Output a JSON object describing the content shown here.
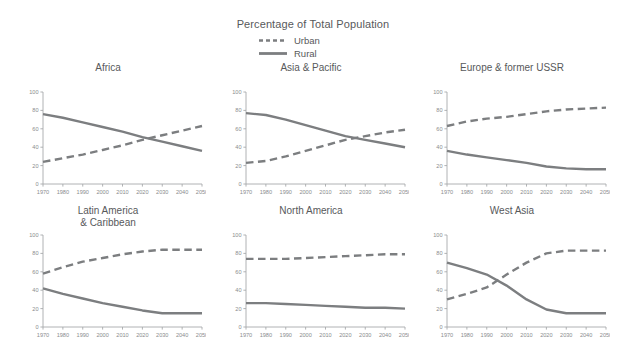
{
  "figure": {
    "title": "Percentage of Total Population",
    "legend": [
      {
        "label": "Urban",
        "style": "dashed",
        "color": "#7c7e80"
      },
      {
        "label": "Rural",
        "style": "solid",
        "color": "#7c7e80"
      }
    ]
  },
  "chart_data": {
    "type": "line",
    "title": "Percentage of Total Population",
    "xlabel": "",
    "ylabel": "",
    "xlim": [
      1970,
      2050
    ],
    "ylim": [
      0,
      100
    ],
    "yticks": [
      0,
      20,
      40,
      60,
      80,
      100
    ],
    "xticks": [
      1970,
      1980,
      1990,
      2000,
      2010,
      2020,
      2030,
      2040,
      2050
    ],
    "grid": false,
    "legend_position": "top-center",
    "legend_entries": [
      "Urban",
      "Rural"
    ],
    "x": [
      1970,
      1980,
      1990,
      2000,
      2010,
      2020,
      2030,
      2040,
      2050
    ],
    "panels": [
      {
        "title": "Africa",
        "title_lines": [
          "Africa"
        ],
        "series": [
          {
            "name": "Urban",
            "style": "dashed",
            "values": [
              24,
              28,
              32,
              37,
              42,
              48,
              53,
              58,
              63
            ]
          },
          {
            "name": "Rural",
            "style": "solid",
            "values": [
              76,
              72,
              67,
              62,
              57,
              51,
              46,
              41,
              36
            ]
          }
        ],
        "crossover_year": 2016,
        "crossover_value": 50
      },
      {
        "title": "Asia & Pacific",
        "title_lines": [
          "Asia & Pacific"
        ],
        "series": [
          {
            "name": "Urban",
            "style": "dashed",
            "values": [
              23,
              25,
              30,
              36,
              42,
              48,
              52,
              56,
              59
            ]
          },
          {
            "name": "Rural",
            "style": "solid",
            "values": [
              77,
              75,
              70,
              64,
              58,
              52,
              48,
              44,
              40
            ]
          }
        ],
        "crossover_year": 2021,
        "crossover_value": 50
      },
      {
        "title": "Europe & former USSR",
        "title_lines": [
          "Europe & former USSR"
        ],
        "series": [
          {
            "name": "Urban",
            "style": "dashed",
            "values": [
              63,
              68,
              71,
              73,
              76,
              79,
              81,
              82,
              83
            ]
          },
          {
            "name": "Rural",
            "style": "solid",
            "values": [
              36,
              32,
              29,
              26,
              23,
              19,
              17,
              16,
              16
            ]
          }
        ],
        "crossover_year": null,
        "crossover_value": null
      },
      {
        "title": "Latin America & Caribbean",
        "title_lines": [
          "Latin America",
          "& Caribbean"
        ],
        "series": [
          {
            "name": "Urban",
            "style": "dashed",
            "values": [
              58,
              65,
              71,
              75,
              79,
              82,
              84,
              84,
              84
            ]
          },
          {
            "name": "Rural",
            "style": "solid",
            "values": [
              42,
              36,
              31,
              26,
              22,
              18,
              15,
              15,
              15
            ]
          }
        ],
        "crossover_year": null,
        "crossover_value": null
      },
      {
        "title": "North America",
        "title_lines": [
          "North America"
        ],
        "series": [
          {
            "name": "Urban",
            "style": "dashed",
            "values": [
              74,
              74,
              74,
              75,
              76,
              77,
              78,
              79,
              79
            ]
          },
          {
            "name": "Rural",
            "style": "solid",
            "values": [
              26,
              26,
              25,
              24,
              23,
              22,
              21,
              21,
              20
            ]
          }
        ],
        "crossover_year": null,
        "crossover_value": null
      },
      {
        "title": "West Asia",
        "title_lines": [
          "West Asia"
        ],
        "series": [
          {
            "name": "Urban",
            "style": "dashed",
            "values": [
              30,
              36,
              43,
              57,
              70,
              80,
              83,
              83,
              83
            ]
          },
          {
            "name": "Rural",
            "style": "solid",
            "values": [
              70,
              64,
              57,
              45,
              30,
              19,
              15,
              15,
              15
            ]
          }
        ],
        "crossover_year": 1995,
        "crossover_value": 50
      }
    ]
  }
}
